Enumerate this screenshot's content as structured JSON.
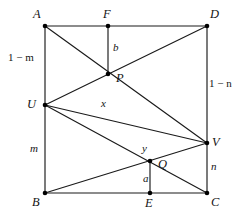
{
  "figure": {
    "background": "#ffffff",
    "stroke": "#1a1a1a",
    "dot_fill": "#000000",
    "width": 242,
    "height": 218
  },
  "vertices": [
    {
      "id": "A",
      "label": "A",
      "x": 45,
      "y": 26,
      "label_x": 33,
      "label_y": 8
    },
    {
      "id": "F",
      "label": "F",
      "x": 108,
      "y": 26,
      "label_x": 103,
      "label_y": 8
    },
    {
      "id": "D",
      "label": "D",
      "x": 207,
      "y": 26,
      "label_x": 210,
      "label_y": 8
    },
    {
      "id": "P",
      "label": "P",
      "x": 108,
      "y": 74,
      "label_x": 116,
      "label_y": 72
    },
    {
      "id": "U",
      "label": "U",
      "x": 45,
      "y": 105,
      "label_x": 27,
      "label_y": 98
    },
    {
      "id": "V",
      "label": "V",
      "x": 207,
      "y": 143,
      "label_x": 212,
      "label_y": 136
    },
    {
      "id": "Q",
      "label": "Q",
      "x": 150,
      "y": 161,
      "label_x": 158,
      "label_y": 158
    },
    {
      "id": "B",
      "label": "B",
      "x": 45,
      "y": 193,
      "label_x": 32,
      "label_y": 196
    },
    {
      "id": "E",
      "label": "E",
      "x": 150,
      "y": 193,
      "label_x": 145,
      "label_y": 197
    },
    {
      "id": "C",
      "label": "C",
      "x": 207,
      "y": 193,
      "label_x": 211,
      "label_y": 196
    }
  ],
  "edges": [
    {
      "name": "side-AD",
      "from": "A",
      "to": "D"
    },
    {
      "name": "side-AU",
      "from": "A",
      "to": "U"
    },
    {
      "name": "side-UB",
      "from": "U",
      "to": "B"
    },
    {
      "name": "side-BC",
      "from": "B",
      "to": "C"
    },
    {
      "name": "side-DV",
      "from": "D",
      "to": "V"
    },
    {
      "name": "side-VC",
      "from": "V",
      "to": "C"
    },
    {
      "name": "cevian-U-to-D",
      "from": "U",
      "to": "D"
    },
    {
      "name": "cevian-A-to-V",
      "from": "A",
      "to": "V"
    },
    {
      "name": "cevian-U-to-V",
      "from": "U",
      "to": "V"
    },
    {
      "name": "cevian-U-to-C",
      "from": "U",
      "to": "C"
    },
    {
      "name": "cevian-B-to-V",
      "from": "B",
      "to": "V"
    },
    {
      "name": "altitude-F-to-P",
      "from": "F",
      "to": "P"
    },
    {
      "name": "altitude-E-to-Q",
      "from": "E",
      "to": "Q"
    }
  ],
  "measures": [
    {
      "id": "one-minus-m",
      "text": "1 − m",
      "italic_part": "m",
      "x": 8,
      "y": 52,
      "kind": "edge"
    },
    {
      "id": "m",
      "text": "m",
      "italic_part": "m",
      "x": 30,
      "y": 143,
      "kind": "edge"
    },
    {
      "id": "one-minus-n",
      "text": "1 − n",
      "italic_part": "n",
      "x": 209,
      "y": 78,
      "kind": "edge"
    },
    {
      "id": "n",
      "text": "n",
      "italic_part": "n",
      "x": 211,
      "y": 161,
      "kind": "edge"
    },
    {
      "id": "b",
      "text": "b",
      "italic_part": "b",
      "x": 113,
      "y": 42,
      "kind": "segment"
    },
    {
      "id": "x",
      "text": "x",
      "italic_part": "x",
      "x": 101,
      "y": 98,
      "kind": "segment"
    },
    {
      "id": "y",
      "text": "y",
      "italic_part": "y",
      "x": 142,
      "y": 143,
      "kind": "segment"
    },
    {
      "id": "a",
      "text": "a",
      "italic_part": "a",
      "x": 143,
      "y": 173,
      "kind": "segment"
    }
  ]
}
